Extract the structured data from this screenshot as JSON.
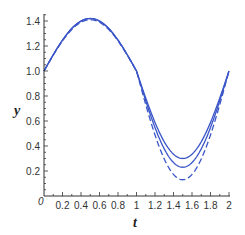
{
  "chart_data": {
    "type": "line",
    "title": "",
    "xlabel": "t",
    "ylabel": "y",
    "xlim": [
      0,
      2
    ],
    "ylim": [
      0,
      1.45
    ],
    "x_ticks": [
      "0.2",
      "0.4",
      "0.6",
      "0.8",
      "1",
      "1.2",
      "1.4",
      "1.6",
      "1.8",
      "2"
    ],
    "y_ticks": [
      "0.2",
      "0.4",
      "0.6",
      "0.8",
      "1.0",
      "1.2",
      "1.4"
    ],
    "origin_label": "0",
    "grid": false,
    "legend": null,
    "color": "#3a55c8",
    "series": [
      {
        "name": "solid-upper",
        "style": "solid",
        "offset": 1.0,
        "amp_up": 0.42,
        "amp_down": 0.7,
        "points": [
          [
            0,
            1.0
          ],
          [
            0.5,
            1.42
          ],
          [
            1.0,
            1.0
          ],
          [
            1.5,
            0.3
          ],
          [
            2.0,
            1.0
          ]
        ]
      },
      {
        "name": "solid-lower",
        "style": "solid",
        "offset": 1.0,
        "amp_up": 0.42,
        "amp_down": 0.77,
        "points": [
          [
            0,
            1.0
          ],
          [
            0.5,
            1.42
          ],
          [
            1.0,
            1.0
          ],
          [
            1.5,
            0.23
          ],
          [
            2.0,
            1.0
          ]
        ]
      },
      {
        "name": "dashed",
        "style": "dashed",
        "offset": 1.0,
        "amp_up": 0.41,
        "amp_down": 0.87,
        "points": [
          [
            0,
            1.0
          ],
          [
            0.5,
            1.41
          ],
          [
            1.0,
            1.0
          ],
          [
            1.5,
            0.13
          ],
          [
            2.0,
            1.0
          ]
        ]
      }
    ]
  }
}
